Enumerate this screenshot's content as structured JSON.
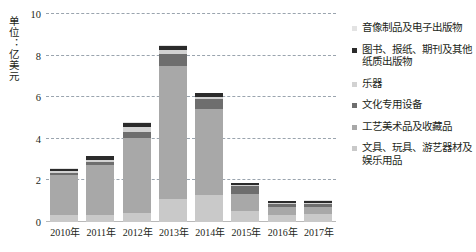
{
  "axis": {
    "unit_caption": "单位：亿美元",
    "y_ticks": [
      "10",
      "8",
      "6",
      "4",
      "2",
      "0"
    ],
    "x_labels": [
      "2010年",
      "2011年",
      "2012年",
      "2013年",
      "2014年",
      "2015年",
      "2016年",
      "2017年"
    ]
  },
  "legend": [
    {
      "label": "音像制品及电子出版物",
      "color": "#e3e3e3"
    },
    {
      "label": "图书、报纸、期刊及其他纸质出版物",
      "color": "#2b2b2b"
    },
    {
      "label": "乐器",
      "color": "#d2d2d2"
    },
    {
      "label": "文化专用设备",
      "color": "#6e6e6e"
    },
    {
      "label": "工艺美术品及收藏品",
      "color": "#a8a8a8"
    },
    {
      "label": "文具、玩具、游艺器材及娱乐用品",
      "color": "#c9c9c9"
    }
  ],
  "chart_data": {
    "type": "bar",
    "stacked": true,
    "title": "",
    "xlabel": "",
    "ylabel": "单位：亿美元",
    "ylim": [
      0,
      10
    ],
    "yticks": [
      0,
      2,
      4,
      6,
      8,
      10
    ],
    "grid": true,
    "legend_position": "right",
    "categories": [
      "2010年",
      "2011年",
      "2012年",
      "2013年",
      "2014年",
      "2015年",
      "2016年",
      "2017年"
    ],
    "series": [
      {
        "name": "文具、玩具、游艺器材及娱乐用品",
        "color": "#c9c9c9",
        "values": [
          0.35,
          0.35,
          0.45,
          1.1,
          1.3,
          0.55,
          0.35,
          0.38
        ]
      },
      {
        "name": "工艺美术品及收藏品",
        "color": "#a8a8a8",
        "values": [
          1.9,
          2.4,
          3.6,
          6.4,
          4.15,
          0.8,
          0.35,
          0.32
        ]
      },
      {
        "name": "文化专用设备",
        "color": "#6e6e6e",
        "values": [
          0.12,
          0.14,
          0.3,
          0.6,
          0.45,
          0.38,
          0.15,
          0.18
        ]
      },
      {
        "name": "乐器",
        "color": "#d2d2d2",
        "values": [
          0.08,
          0.1,
          0.2,
          0.15,
          0.1,
          0.05,
          0.05,
          0.04
        ]
      },
      {
        "name": "图书、报纸、期刊及其他纸质出版物",
        "color": "#2b2b2b",
        "values": [
          0.12,
          0.18,
          0.22,
          0.22,
          0.18,
          0.1,
          0.09,
          0.11
        ]
      },
      {
        "name": "音像制品及电子出版物",
        "color": "#e3e3e3",
        "values": [
          0.03,
          0.03,
          0.03,
          0.03,
          0.02,
          0.02,
          0.01,
          0.01
        ]
      }
    ],
    "totals": [
      2.6,
      3.2,
      4.8,
      8.5,
      6.2,
      1.9,
      1.0,
      1.04
    ]
  }
}
